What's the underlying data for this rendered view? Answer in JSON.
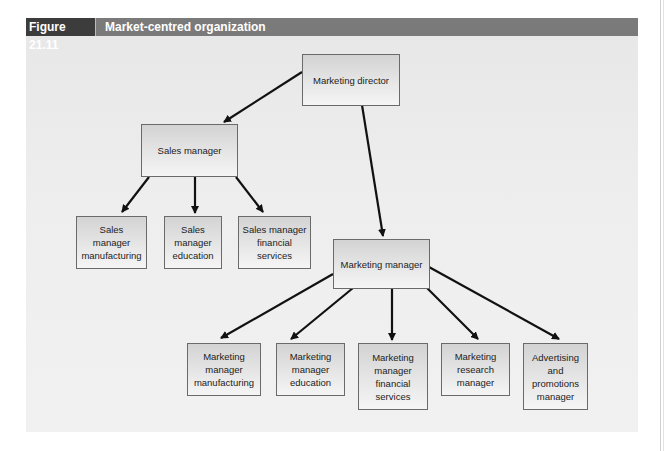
{
  "figure": {
    "number": "Figure 21.11",
    "title": "Market-centred organization"
  },
  "colors": {
    "title_bar": "#7a7a7a",
    "figure_number_bg": "#3c3c3c",
    "box_border": "#6a6a6a",
    "arrow": "#111111"
  },
  "nodes": {
    "marketing_director": "Marketing director",
    "sales_manager": "Sales manager",
    "sales_manufacturing": "Sales\nmanager\nmanufacturing",
    "sales_education": "Sales\nmanager\neducation",
    "sales_financial": "Sales manager\nfinancial\nservices",
    "marketing_manager": "Marketing manager",
    "mm_manufacturing": "Marketing\nmanager\nmanufacturing",
    "mm_education": "Marketing\nmanager\neducation",
    "mm_financial": "Marketing\nmanager\nfinancial\nservices",
    "research_manager": "Marketing\nresearch\nmanager",
    "advertising_manager": "Advertising\nand\npromotions\nmanager"
  },
  "edges": [
    {
      "from": "marketing_director",
      "to": "sales_manager"
    },
    {
      "from": "marketing_director",
      "to": "marketing_manager"
    },
    {
      "from": "sales_manager",
      "to": "sales_manufacturing"
    },
    {
      "from": "sales_manager",
      "to": "sales_education"
    },
    {
      "from": "sales_manager",
      "to": "sales_financial"
    },
    {
      "from": "marketing_manager",
      "to": "mm_manufacturing"
    },
    {
      "from": "marketing_manager",
      "to": "mm_education"
    },
    {
      "from": "marketing_manager",
      "to": "mm_financial"
    },
    {
      "from": "marketing_manager",
      "to": "research_manager"
    },
    {
      "from": "marketing_manager",
      "to": "advertising_manager"
    }
  ]
}
